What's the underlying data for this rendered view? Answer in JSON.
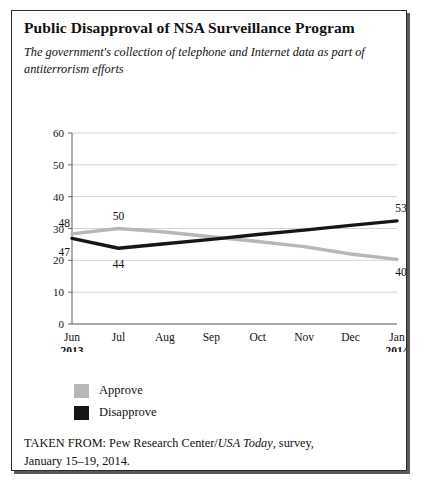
{
  "figure": {
    "title": "Public Disapproval of NSA Surveillance Program",
    "subtitle": "The government's collection of telephone and Internet data as part of antiterrorism efforts",
    "source_prefix": "TAKEN FROM: Pew Research Center/",
    "source_italic": "USA Today",
    "source_suffix": ", survey,",
    "source_line2": "January 15–19, 2014."
  },
  "legend": {
    "items": [
      {
        "label": "Approve",
        "color": "#b7b7b7"
      },
      {
        "label": "Disapprove",
        "color": "#161616"
      }
    ]
  },
  "chart_data": {
    "type": "line",
    "title": "Public Disapproval of NSA Surveillance Program",
    "subtitle": "The government's collection of telephone and Internet data as part of antiterrorism efforts",
    "xlabel": "",
    "ylabel": "",
    "ylim": [
      0,
      60
    ],
    "yticks": [
      0,
      10,
      20,
      30,
      40,
      50,
      60
    ],
    "ytick_labels": [
      "0",
      "10",
      "20",
      "30",
      "40",
      "50",
      "60"
    ],
    "grid": true,
    "grid_axis": "y",
    "legend_position": "below-left",
    "categories": [
      "Jun",
      "Jul",
      "Aug",
      "Sep",
      "Oct",
      "Nov",
      "Dec",
      "Jan"
    ],
    "category_sublabels": [
      "2013",
      "",
      "",
      "",
      "",
      "",
      "",
      "2014"
    ],
    "series": [
      {
        "name": "Approve",
        "color": "#b7b7b7",
        "values": [
          48,
          50,
          null,
          null,
          null,
          null,
          null,
          40
        ],
        "plotted": [
          28.3,
          30.0,
          28.9,
          27.4,
          25.9,
          24.3,
          22.0,
          20.3
        ],
        "labels": [
          {
            "x": 0,
            "text": "48"
          },
          {
            "x": 1,
            "text": "50"
          },
          {
            "x": 7,
            "text": "40"
          }
        ]
      },
      {
        "name": "Disapprove",
        "color": "#161616",
        "values": [
          47,
          44,
          null,
          null,
          null,
          null,
          null,
          53
        ],
        "plotted": [
          26.9,
          23.8,
          25.2,
          26.6,
          28.1,
          29.5,
          31.0,
          32.4
        ],
        "labels": [
          {
            "x": 0,
            "text": "47"
          },
          {
            "x": 1,
            "text": "44"
          },
          {
            "x": 7,
            "text": "53"
          }
        ]
      }
    ]
  }
}
